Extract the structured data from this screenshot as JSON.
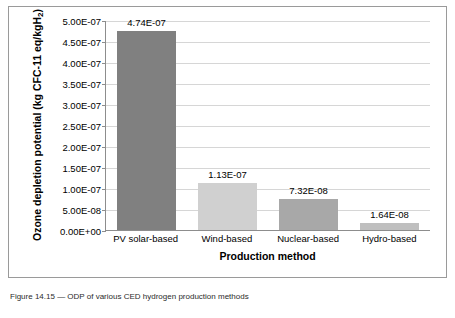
{
  "chart_data": {
    "type": "bar",
    "title": "",
    "xlabel": "Production method",
    "ylabel": "Ozone depletion potential (kg CFC-11 eq/kgH2)",
    "ylabel_main": "Ozone depletion potential (kg CFC-11 eq/kgH",
    "ylabel_sub": "2",
    "ylabel_close": ")",
    "categories": [
      "PV solar-based",
      "Wind-based",
      "Nuclear-based",
      "Hydro-based"
    ],
    "values": [
      4.74e-07,
      1.13e-07,
      7.32e-08,
      1.64e-08
    ],
    "value_labels": [
      "4.74E-07",
      "1.13E-07",
      "7.32E-08",
      "1.64E-08"
    ],
    "bar_colors": [
      "#808080",
      "#d0d0d0",
      "#a8a8a8",
      "#bfbfbf"
    ],
    "ylim": [
      0,
      5e-07
    ],
    "yticks": [
      0,
      5e-08,
      1e-07,
      1.5e-07,
      2e-07,
      2.5e-07,
      3e-07,
      3.5e-07,
      4e-07,
      4.5e-07,
      5e-07
    ],
    "ytick_labels": [
      "0.00E+00",
      "5.00E-08",
      "1.00E-07",
      "1.50E-07",
      "2.00E-07",
      "2.50E-07",
      "3.00E-07",
      "3.50E-07",
      "4.00E-07",
      "4.50E-07",
      "5.00E-07"
    ],
    "grid": true,
    "legend": false
  },
  "caption": "Figure 14.15 — ODP of various CED hydrogen production methods"
}
